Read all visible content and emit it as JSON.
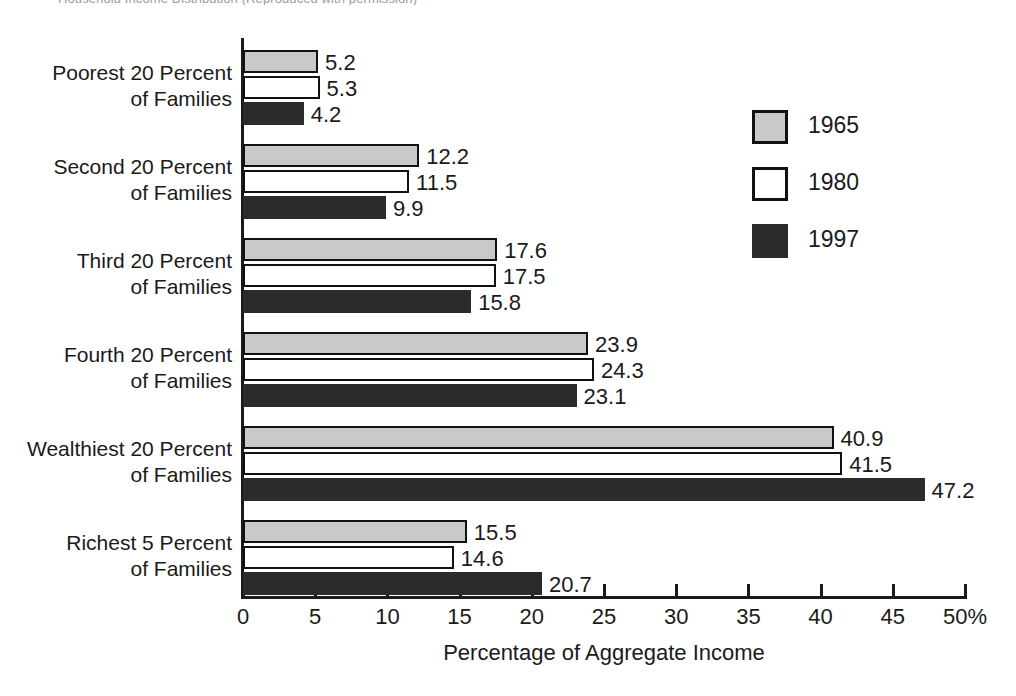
{
  "top_caption": "Household Income Distribution (Reproduced with permission)",
  "chart_data": {
    "type": "bar",
    "orientation": "horizontal",
    "title": "",
    "xlabel": "Percentage of Aggregate Income",
    "ylabel": "",
    "xlim": [
      0,
      50
    ],
    "xticks": [
      0,
      5,
      10,
      15,
      20,
      25,
      30,
      35,
      40,
      45,
      50
    ],
    "xtick_labels": [
      "0",
      "5",
      "10",
      "15",
      "20",
      "25",
      "30",
      "35",
      "40",
      "45",
      "50%"
    ],
    "grid": false,
    "legend_position": "right",
    "categories": [
      "Poorest 20 Percent\nof Families",
      "Second 20 Percent\nof Families",
      "Third 20 Percent\nof Families",
      "Fourth 20 Percent\nof Families",
      "Wealthiest 20 Percent\nof Families",
      "Richest 5 Percent\nof Families"
    ],
    "category_lines": [
      [
        "Poorest 20 Percent",
        "of Families"
      ],
      [
        "Second 20 Percent",
        "of Families"
      ],
      [
        "Third 20 Percent",
        "of Families"
      ],
      [
        "Fourth 20 Percent",
        "of Families"
      ],
      [
        "Wealthiest 20 Percent",
        "of Families"
      ],
      [
        "Richest 5 Percent",
        "of Families"
      ]
    ],
    "series": [
      {
        "name": "1965",
        "color": "#c9c9c9",
        "values": [
          5.2,
          12.2,
          17.6,
          23.9,
          40.9,
          15.5
        ],
        "labels": [
          "5.2",
          "12.2",
          "17.6",
          "23.9",
          "40.9",
          "15.5"
        ]
      },
      {
        "name": "1980",
        "color": "#ffffff",
        "values": [
          5.3,
          11.5,
          17.5,
          24.3,
          41.5,
          14.6
        ],
        "labels": [
          "5.3",
          "11.5",
          "17.5",
          "24.3",
          "41.5",
          "14.6"
        ]
      },
      {
        "name": "1997",
        "color": "#2b2b2b",
        "values": [
          4.2,
          9.9,
          15.8,
          23.1,
          47.2,
          20.7
        ],
        "labels": [
          "4.2",
          "9.9",
          "15.8",
          "23.1",
          "47.2",
          "20.7"
        ]
      }
    ]
  },
  "legend": {
    "entries": [
      {
        "label": "1965",
        "swatch": "s1965"
      },
      {
        "label": "1980",
        "swatch": "s1980"
      },
      {
        "label": "1997",
        "swatch": "s1997"
      }
    ]
  },
  "colors": {
    "series_1965": "#c9c9c9",
    "series_1980": "#ffffff",
    "series_1997": "#2b2b2b",
    "axis": "#1a1a1a",
    "background": "#ffffff"
  }
}
